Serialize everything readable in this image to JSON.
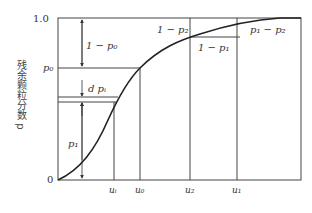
{
  "diagram": {
    "type": "cumulative residual particle fraction curve",
    "y_axis": {
      "label": "残余颗粒分数 p",
      "ticks": [
        {
          "label": "1.0",
          "value": 1.0
        },
        {
          "label": "p₀",
          "value": "p0"
        },
        {
          "label": "0",
          "value": 0
        }
      ]
    },
    "x_axis": {
      "ticks": [
        {
          "label": "uᵢ",
          "id": "u_i"
        },
        {
          "label": "u₀",
          "id": "u_0"
        },
        {
          "label": "u₂",
          "id": "u_2"
        },
        {
          "label": "u₁",
          "id": "u_1"
        }
      ]
    },
    "annotations": {
      "one_minus_p0": "1 − p₀",
      "dpi": "d pᵢ",
      "p1": "p₁",
      "one_minus_p2": "1 − p₂",
      "one_minus_p1": "1 − p₁",
      "p1_minus_p2": "p₁ − p₂"
    },
    "colors": {
      "line": "#333333",
      "background": "#ffffff"
    }
  }
}
